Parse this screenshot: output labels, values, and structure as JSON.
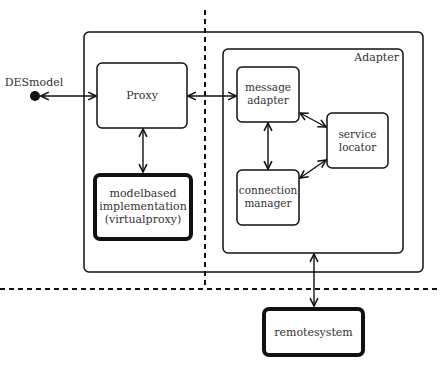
{
  "diagram": {
    "external_node": {
      "label": "DESmodel"
    },
    "container": {
      "label": "Adapter"
    },
    "nodes": {
      "proxy": {
        "label": "Proxy"
      },
      "message_adapter": {
        "line1": "message",
        "line2": "adapter"
      },
      "service_locator": {
        "line1": "service",
        "line2": "locator"
      },
      "connection_manager": {
        "line1": "connection",
        "line2": "manager"
      },
      "modelbased": {
        "line1": "modelbased",
        "line2": "implementation",
        "line3": "(virtualproxy)"
      },
      "remotesystem": {
        "label": "remotesystem"
      }
    },
    "edges": [
      {
        "from": "DESmodel",
        "to": "Proxy",
        "type": "bidirectional"
      },
      {
        "from": "Proxy",
        "to": "message adapter",
        "type": "bidirectional"
      },
      {
        "from": "Proxy",
        "to": "modelbased implementation (virtualproxy)",
        "type": "bidirectional"
      },
      {
        "from": "message adapter",
        "to": "connection manager",
        "type": "bidirectional"
      },
      {
        "from": "message adapter",
        "to": "service locator",
        "type": "bidirectional"
      },
      {
        "from": "connection manager",
        "to": "service locator",
        "type": "bidirectional"
      },
      {
        "from": "Adapter",
        "to": "remotesystem",
        "type": "bidirectional"
      }
    ]
  }
}
